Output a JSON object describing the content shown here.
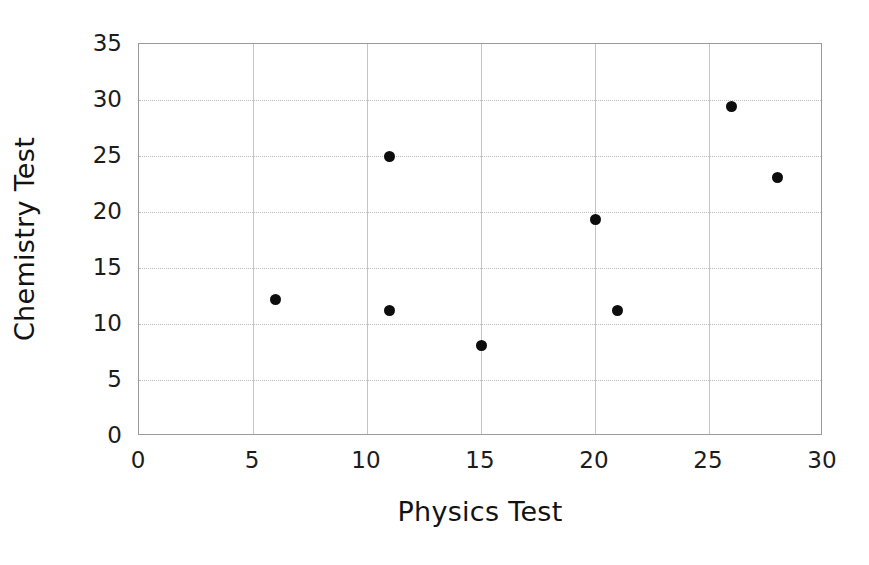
{
  "chart_data": {
    "type": "scatter",
    "title": "",
    "xlabel": "Physics Test",
    "ylabel": "Chemistry Test",
    "xlim": [
      0,
      30
    ],
    "ylim": [
      0,
      35
    ],
    "xticks": [
      0,
      5,
      10,
      15,
      20,
      25,
      30
    ],
    "yticks": [
      0,
      5,
      10,
      15,
      20,
      25,
      30,
      35
    ],
    "xtick_labels": [
      "0",
      "5",
      "10",
      "15",
      "20",
      "25",
      "30"
    ],
    "ytick_labels": [
      "0",
      "5",
      "10",
      "15",
      "20",
      "25",
      "30",
      "35"
    ],
    "grid": true,
    "grid_color": "#bdbdbd",
    "legend": null,
    "marker": {
      "shape": "circle",
      "color": "#0d0d0d",
      "size": 11
    },
    "points": [
      {
        "x": 6,
        "y": 12.2
      },
      {
        "x": 11,
        "y": 25.0
      },
      {
        "x": 11,
        "y": 11.2
      },
      {
        "x": 15,
        "y": 8.1
      },
      {
        "x": 20,
        "y": 19.3
      },
      {
        "x": 21,
        "y": 11.2
      },
      {
        "x": 26,
        "y": 29.4
      },
      {
        "x": 28,
        "y": 23.1
      }
    ],
    "x": [
      6,
      11,
      11,
      15,
      20,
      21,
      26,
      28
    ],
    "y": [
      12.2,
      25.0,
      11.2,
      8.1,
      19.3,
      11.2,
      29.4,
      23.1
    ]
  },
  "figure": {
    "background_color": "#ffffff",
    "axis_color": "#9a9a9a"
  }
}
